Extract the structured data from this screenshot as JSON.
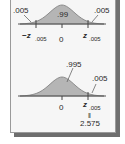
{
  "diagram": {
    "colors": {
      "fill": "#b5b5b5",
      "stroke": "#6a6a6a",
      "panel": "#f6f6f6",
      "shadow": "#6e6e6e"
    },
    "two_tailed": {
      "left_tail": ".005",
      "right_tail": ".005",
      "center_area": ".99",
      "left_critical": "−z",
      "left_critical_sub": ".005",
      "zero": "0",
      "right_critical": "z",
      "right_critical_sub": ".005"
    },
    "one_tailed": {
      "left_area": ".995",
      "right_tail": ".005",
      "zero": "0",
      "right_critical": "z",
      "right_critical_sub": ".005",
      "equals": "‖",
      "critical_value": "2.575"
    }
  }
}
